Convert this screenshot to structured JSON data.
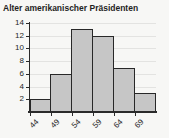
{
  "title": "Alter amerikanischer Präsidenten",
  "chart_data": {
    "type": "bar",
    "subtype": "histogram",
    "title": "Alter amerikanischer Präsidenten",
    "x_tick_labels": [
      "44",
      "49",
      "54",
      "59",
      "64",
      "69"
    ],
    "bin_width": 5,
    "values": [
      2,
      6,
      13,
      12,
      7,
      3
    ],
    "y_ticks": [
      2,
      4,
      6,
      8,
      10,
      12,
      14
    ],
    "ylim": [
      0,
      14
    ],
    "xlabel": "",
    "ylabel": "",
    "grid": "horizontal",
    "legend": "none"
  },
  "colors": {
    "background": "#f7f7f5",
    "text": "#1f1f1f",
    "axis": "#2a2a2a",
    "grid": "#e3e3e1",
    "bar_fill": "#c6c6c6",
    "bar_border": "#282828"
  }
}
